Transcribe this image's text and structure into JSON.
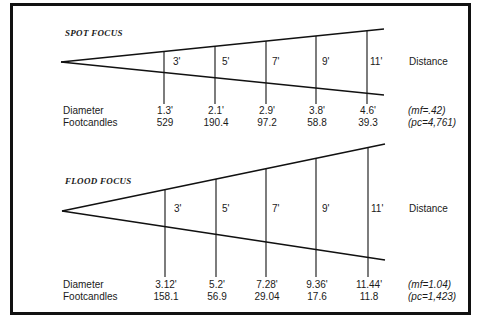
{
  "diagrams": [
    {
      "title": "SPOT FOCUS",
      "distance_label": "Distance",
      "row_labels": {
        "diameter": "Diameter",
        "footcandles": "Footcandles"
      },
      "distances": [
        "3'",
        "5'",
        "7'",
        "9'",
        "11'"
      ],
      "diameters": [
        "1.3'",
        "2.1'",
        "2.9'",
        "3.8'",
        "4.6'"
      ],
      "footcandles": [
        "529",
        "190.4",
        "97.2",
        "58.8",
        "39.3"
      ],
      "notes": {
        "mf": "(mf=.42)",
        "pc": "(pc=4,761)"
      }
    },
    {
      "title": "FLOOD FOCUS",
      "distance_label": "Distance",
      "row_labels": {
        "diameter": "Diameter",
        "footcandles": "Footcandles"
      },
      "distances": [
        "3'",
        "5'",
        "7'",
        "9'",
        "11'"
      ],
      "diameters": [
        "3.12'",
        "5.2'",
        "7.28'",
        "9.36'",
        "11.44'"
      ],
      "footcandles": [
        "158.1",
        "56.9",
        "29.04",
        "17.6",
        "11.8"
      ],
      "notes": {
        "mf": "(mf=1.04)",
        "pc": "(pc=1,423)"
      }
    }
  ]
}
